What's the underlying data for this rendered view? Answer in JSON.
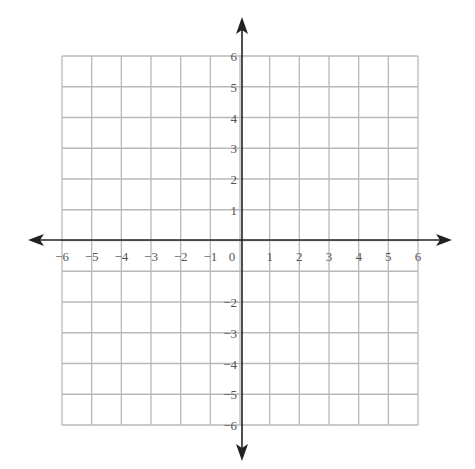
{
  "chart_data": {
    "type": "scatter",
    "title": "",
    "xlabel": "",
    "ylabel": "",
    "xlim": [
      -6,
      6
    ],
    "ylim": [
      -6,
      6
    ],
    "grid": true,
    "points": [],
    "x_tick_labels": [
      "−6",
      "−5",
      "−4",
      "−3",
      "−2",
      "−1",
      "0",
      "1",
      "2",
      "3",
      "4",
      "5",
      "6"
    ],
    "y_tick_labels": [
      "6",
      "5",
      "4",
      "3",
      "2",
      "1",
      "−2",
      "−3",
      "−4",
      "−5",
      "−6"
    ],
    "y_tick_values": [
      6,
      5,
      4,
      3,
      2,
      1,
      -2,
      -3,
      -4,
      -5,
      -6
    ],
    "x_tick_values": [
      -6,
      -5,
      -4,
      -3,
      -2,
      -1,
      0,
      1,
      2,
      3,
      4,
      5,
      6
    ],
    "axes_arrows": true
  },
  "colors": {
    "grid": "#b8b8b8",
    "axis": "#222222",
    "label": "#555555"
  }
}
